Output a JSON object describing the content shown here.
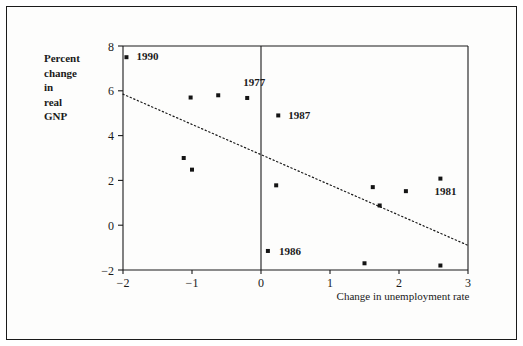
{
  "chart_data": {
    "type": "scatter",
    "title": "",
    "xlabel": "Change in unemployment rate",
    "ylabel": "Percent change in real GNP",
    "ylabel_lines": [
      "Percent",
      "change",
      "in",
      "real",
      "GNP"
    ],
    "xlim": [
      -2,
      3
    ],
    "ylim": [
      -2,
      8
    ],
    "xticks": [
      -2,
      -1,
      0,
      1,
      2,
      3
    ],
    "xtick_labels": [
      "−2",
      "−1",
      "0",
      "1",
      "2",
      "3"
    ],
    "yticks": [
      -2,
      0,
      2,
      4,
      6,
      8
    ],
    "ytick_labels": [
      "−2",
      "0",
      "2",
      "4",
      "6",
      "8"
    ],
    "grid": false,
    "legend": null,
    "points": [
      {
        "x": -1.95,
        "y": 7.5,
        "label": "1990",
        "label_dx": 10,
        "label_dy": 3
      },
      {
        "x": -1.02,
        "y": 5.7,
        "label": "",
        "label_dx": 0,
        "label_dy": 0
      },
      {
        "x": -0.62,
        "y": 5.8,
        "label": "",
        "label_dx": 0,
        "label_dy": 0
      },
      {
        "x": -0.2,
        "y": 5.68,
        "label": "1977",
        "label_dx": -4,
        "label_dy": -12
      },
      {
        "x": 0.25,
        "y": 4.9,
        "label": "1987",
        "label_dx": 10,
        "label_dy": 4
      },
      {
        "x": -1.12,
        "y": 3.0,
        "label": "",
        "label_dx": 0,
        "label_dy": 0
      },
      {
        "x": -1.0,
        "y": 2.48,
        "label": "",
        "label_dx": 0,
        "label_dy": 0
      },
      {
        "x": 0.22,
        "y": 1.78,
        "label": "",
        "label_dx": 0,
        "label_dy": 0
      },
      {
        "x": 1.62,
        "y": 1.7,
        "label": "",
        "label_dx": 0,
        "label_dy": 0
      },
      {
        "x": 2.1,
        "y": 1.52,
        "label": "",
        "label_dx": 0,
        "label_dy": 0
      },
      {
        "x": 2.6,
        "y": 2.08,
        "label": "1981",
        "label_dx": -6,
        "label_dy": 16
      },
      {
        "x": 1.72,
        "y": 0.88,
        "label": "",
        "label_dx": 0,
        "label_dy": 0
      },
      {
        "x": 0.1,
        "y": -1.15,
        "label": "1986",
        "label_dx": 11,
        "label_dy": 4
      },
      {
        "x": 1.5,
        "y": -1.7,
        "label": "",
        "label_dx": 0,
        "label_dy": 0
      },
      {
        "x": 2.6,
        "y": -1.8,
        "label": "",
        "label_dx": 0,
        "label_dy": 0
      }
    ],
    "trendline": {
      "x0": -2.0,
      "y0": 5.85,
      "x1": 3.0,
      "y1": -0.9,
      "style": "dotted"
    },
    "vertical_reference_line": {
      "x": 0
    }
  },
  "colors": {
    "ink": "#1a1a1a",
    "paper": "#fdfdfc",
    "point": "#141414"
  }
}
